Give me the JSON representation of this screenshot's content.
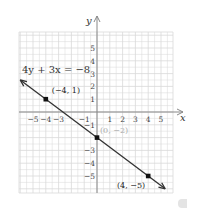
{
  "chart_data": {
    "type": "line",
    "title": "",
    "equation": "4y + 3x = −8",
    "xlabel": "x",
    "ylabel": "y",
    "xlim": [
      -6,
      6
    ],
    "ylim": [
      -6,
      6
    ],
    "grid": true,
    "x_ticks": [
      "−5",
      "−4",
      "−3",
      "−1",
      "1",
      "2",
      "3",
      "4",
      "5"
    ],
    "x_tick_values": [
      -5,
      -4,
      -3,
      -1,
      1,
      2,
      3,
      4,
      5
    ],
    "y_ticks": [
      "5",
      "4",
      "3",
      "2",
      "1",
      "−1",
      "−3",
      "−4",
      "−5"
    ],
    "y_tick_values": [
      5,
      4,
      3,
      2,
      1,
      -1,
      -3,
      -4,
      -5
    ],
    "series": [
      {
        "name": "4y + 3x = −8",
        "slope": -0.75,
        "intercept": -2,
        "x": [
          -6,
          5.33
        ],
        "y": [
          2.5,
          -6
        ],
        "arrows": "both"
      }
    ],
    "points": [
      {
        "x": -4,
        "y": 1,
        "label": "(−4, 1)",
        "label_color": "#222222"
      },
      {
        "x": 0,
        "y": -2,
        "label": "(0, −2)",
        "label_color": "#aaaaaa"
      },
      {
        "x": 4,
        "y": -5,
        "label": "(4, −5)",
        "label_color": "#222222"
      }
    ],
    "colors": {
      "grid": "#d9d9d9",
      "axis": "#888888",
      "line": "#333333",
      "point": "#111111",
      "text": "#333333"
    }
  }
}
